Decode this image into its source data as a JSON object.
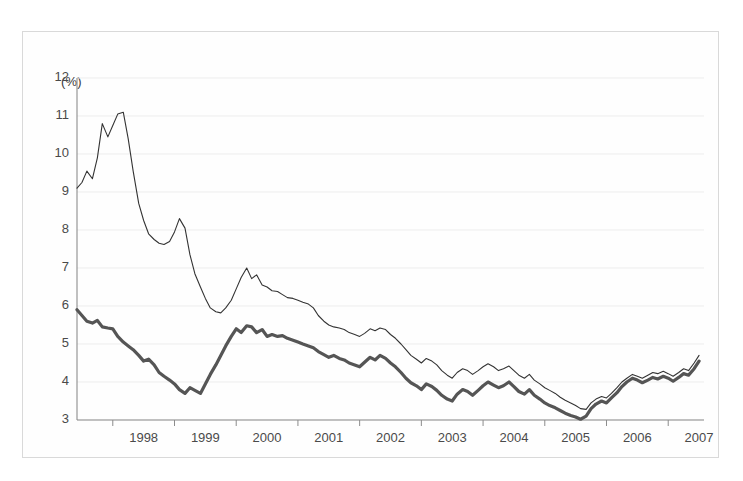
{
  "chart_data": {
    "type": "line",
    "title": "",
    "subtitle": "",
    "xlabel": "",
    "ylabel": "(%)",
    "unit_label": "(%)",
    "grid": true,
    "legend": "none",
    "xlim": [
      1997.42,
      2007.58
    ],
    "ylim": [
      3,
      12
    ],
    "ytick_labels": [
      "12",
      "11",
      "10",
      "9",
      "8",
      "7",
      "6",
      "5",
      "4",
      "3"
    ],
    "ytick_values": [
      12,
      11,
      10,
      9,
      8,
      7,
      6,
      5,
      4,
      3
    ],
    "xtick_labels": [
      "1998",
      "1999",
      "2000",
      "2001",
      "2002",
      "2003",
      "2004",
      "2005",
      "2006",
      "2007"
    ],
    "xtick_values": [
      1998,
      1999,
      2000,
      2001,
      2002,
      2003,
      2004,
      2005,
      2006,
      2007
    ],
    "x_boundaries": [
      1998,
      1999,
      2000,
      2001,
      2002,
      2003,
      2004,
      2005,
      2006,
      2007
    ],
    "series": [
      {
        "name": "upper-series",
        "style": "thin",
        "color": "#333333",
        "width": 1.1,
        "x": [
          1997.42,
          1997.5,
          1997.58,
          1997.67,
          1997.75,
          1997.83,
          1997.92,
          1998.0,
          1998.08,
          1998.17,
          1998.25,
          1998.33,
          1998.42,
          1998.5,
          1998.58,
          1998.67,
          1998.75,
          1998.83,
          1998.92,
          1999.0,
          1999.08,
          1999.17,
          1999.25,
          1999.33,
          1999.42,
          1999.5,
          1999.58,
          1999.67,
          1999.75,
          1999.83,
          1999.92,
          2000.0,
          2000.08,
          2000.17,
          2000.25,
          2000.33,
          2000.42,
          2000.5,
          2000.58,
          2000.67,
          2000.75,
          2000.83,
          2000.92,
          2001.0,
          2001.08,
          2001.17,
          2001.25,
          2001.33,
          2001.42,
          2001.5,
          2001.58,
          2001.67,
          2001.75,
          2001.83,
          2001.92,
          2002.0,
          2002.08,
          2002.17,
          2002.25,
          2002.33,
          2002.42,
          2002.5,
          2002.58,
          2002.67,
          2002.75,
          2002.83,
          2002.92,
          2003.0,
          2003.08,
          2003.17,
          2003.25,
          2003.33,
          2003.42,
          2003.5,
          2003.58,
          2003.67,
          2003.75,
          2003.83,
          2003.92,
          2004.0,
          2004.08,
          2004.17,
          2004.25,
          2004.33,
          2004.42,
          2004.5,
          2004.58,
          2004.67,
          2004.75,
          2004.83,
          2004.92,
          2005.0,
          2005.08,
          2005.17,
          2005.25,
          2005.33,
          2005.42,
          2005.5,
          2005.58,
          2005.67,
          2005.75,
          2005.83,
          2005.92,
          2006.0,
          2006.08,
          2006.17,
          2006.25,
          2006.33,
          2006.42,
          2006.5,
          2006.58,
          2006.67,
          2006.75,
          2006.83,
          2006.92,
          2007.0,
          2007.08,
          2007.17,
          2007.25,
          2007.33,
          2007.42,
          2007.5
        ],
        "values": [
          9.1,
          9.25,
          9.55,
          9.35,
          9.9,
          10.8,
          10.45,
          10.75,
          11.05,
          11.1,
          10.4,
          9.55,
          8.7,
          8.25,
          7.9,
          7.75,
          7.65,
          7.62,
          7.7,
          7.95,
          8.3,
          8.05,
          7.35,
          6.85,
          6.5,
          6.2,
          5.95,
          5.85,
          5.82,
          5.95,
          6.15,
          6.45,
          6.75,
          7.0,
          6.72,
          6.82,
          6.55,
          6.5,
          6.4,
          6.38,
          6.3,
          6.22,
          6.2,
          6.15,
          6.1,
          6.05,
          5.95,
          5.75,
          5.6,
          5.5,
          5.45,
          5.42,
          5.38,
          5.3,
          5.25,
          5.2,
          5.28,
          5.4,
          5.35,
          5.42,
          5.38,
          5.25,
          5.15,
          5.0,
          4.85,
          4.7,
          4.6,
          4.5,
          4.62,
          4.55,
          4.45,
          4.3,
          4.18,
          4.1,
          4.25,
          4.35,
          4.3,
          4.2,
          4.3,
          4.4,
          4.48,
          4.4,
          4.3,
          4.35,
          4.42,
          4.3,
          4.18,
          4.1,
          4.2,
          4.05,
          3.95,
          3.85,
          3.78,
          3.7,
          3.6,
          3.52,
          3.45,
          3.38,
          3.3,
          3.28,
          3.45,
          3.55,
          3.62,
          3.58,
          3.7,
          3.85,
          4.0,
          4.1,
          4.2,
          4.15,
          4.1,
          4.18,
          4.25,
          4.22,
          4.28,
          4.22,
          4.15,
          4.25,
          4.35,
          4.3,
          4.5,
          4.7
        ]
      },
      {
        "name": "lower-series",
        "style": "thick",
        "color": "#555555",
        "width": 3.2,
        "x": [
          1997.42,
          1997.5,
          1997.58,
          1997.67,
          1997.75,
          1997.83,
          1997.92,
          1998.0,
          1998.08,
          1998.17,
          1998.25,
          1998.33,
          1998.42,
          1998.5,
          1998.58,
          1998.67,
          1998.75,
          1998.83,
          1998.92,
          1999.0,
          1999.08,
          1999.17,
          1999.25,
          1999.33,
          1999.42,
          1999.5,
          1999.58,
          1999.67,
          1999.75,
          1999.83,
          1999.92,
          2000.0,
          2000.08,
          2000.17,
          2000.25,
          2000.33,
          2000.42,
          2000.5,
          2000.58,
          2000.67,
          2000.75,
          2000.83,
          2000.92,
          2001.0,
          2001.08,
          2001.17,
          2001.25,
          2001.33,
          2001.42,
          2001.5,
          2001.58,
          2001.67,
          2001.75,
          2001.83,
          2001.92,
          2002.0,
          2002.08,
          2002.17,
          2002.25,
          2002.33,
          2002.42,
          2002.5,
          2002.58,
          2002.67,
          2002.75,
          2002.83,
          2002.92,
          2003.0,
          2003.08,
          2003.17,
          2003.25,
          2003.33,
          2003.42,
          2003.5,
          2003.58,
          2003.67,
          2003.75,
          2003.83,
          2003.92,
          2004.0,
          2004.08,
          2004.17,
          2004.25,
          2004.33,
          2004.42,
          2004.5,
          2004.58,
          2004.67,
          2004.75,
          2004.83,
          2004.92,
          2005.0,
          2005.08,
          2005.17,
          2005.25,
          2005.33,
          2005.42,
          2005.5,
          2005.58,
          2005.67,
          2005.75,
          2005.83,
          2005.92,
          2006.0,
          2006.08,
          2006.17,
          2006.25,
          2006.33,
          2006.42,
          2006.5,
          2006.58,
          2006.67,
          2006.75,
          2006.83,
          2006.92,
          2007.0,
          2007.08,
          2007.17,
          2007.25,
          2007.33,
          2007.42,
          2007.5
        ],
        "values": [
          5.9,
          5.75,
          5.6,
          5.55,
          5.62,
          5.45,
          5.42,
          5.4,
          5.2,
          5.05,
          4.95,
          4.85,
          4.7,
          4.55,
          4.6,
          4.45,
          4.25,
          4.15,
          4.05,
          3.95,
          3.8,
          3.7,
          3.85,
          3.78,
          3.7,
          3.95,
          4.2,
          4.45,
          4.7,
          4.95,
          5.2,
          5.4,
          5.3,
          5.48,
          5.45,
          5.3,
          5.38,
          5.2,
          5.25,
          5.2,
          5.22,
          5.15,
          5.1,
          5.05,
          5.0,
          4.95,
          4.9,
          4.8,
          4.72,
          4.65,
          4.7,
          4.62,
          4.58,
          4.5,
          4.45,
          4.4,
          4.52,
          4.65,
          4.58,
          4.7,
          4.62,
          4.5,
          4.4,
          4.25,
          4.1,
          3.98,
          3.9,
          3.8,
          3.95,
          3.88,
          3.78,
          3.65,
          3.55,
          3.5,
          3.68,
          3.8,
          3.75,
          3.65,
          3.78,
          3.9,
          4.0,
          3.92,
          3.85,
          3.9,
          4.0,
          3.88,
          3.75,
          3.68,
          3.8,
          3.65,
          3.55,
          3.45,
          3.38,
          3.32,
          3.25,
          3.18,
          3.12,
          3.08,
          3.02,
          3.1,
          3.3,
          3.42,
          3.5,
          3.45,
          3.58,
          3.72,
          3.88,
          4.0,
          4.1,
          4.05,
          3.98,
          4.05,
          4.12,
          4.08,
          4.15,
          4.1,
          4.02,
          4.12,
          4.22,
          4.18,
          4.35,
          4.55
        ]
      }
    ]
  },
  "axis": {
    "unit_label": "(%)",
    "y_labels": [
      "12",
      "11",
      "10",
      "9",
      "8",
      "7",
      "6",
      "5",
      "4",
      "3"
    ],
    "x_labels": [
      "1998",
      "1999",
      "2000",
      "2001",
      "2002",
      "2003",
      "2004",
      "2005",
      "2006",
      "2007"
    ]
  },
  "colors": {
    "frame": "#d9d9d9",
    "grid": "#ededed",
    "axis": "#8c8c8c",
    "upper_line": "#333333",
    "lower_line": "#555555",
    "text": "#4a4a4a"
  }
}
